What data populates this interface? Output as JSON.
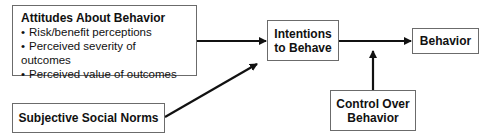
{
  "diagram": {
    "nodes": {
      "attitudes": {
        "title": "Attitudes About Behavior",
        "items": [
          "Risk/benefit perceptions",
          "Perceived severity of outcomes",
          "Perceived value of outcomes"
        ]
      },
      "norms": {
        "title": "Subjective Social Norms"
      },
      "intentions": {
        "line1": "Intentions",
        "line2": "to Behave"
      },
      "behavior": {
        "title": "Behavior"
      },
      "control": {
        "line1": "Control Over",
        "line2": "Behavior"
      }
    },
    "edges": [
      {
        "from": "attitudes",
        "to": "intentions"
      },
      {
        "from": "norms",
        "to": "intentions"
      },
      {
        "from": "intentions",
        "to": "behavior"
      },
      {
        "from": "control",
        "to": "intentions-behavior-edge"
      }
    ]
  }
}
